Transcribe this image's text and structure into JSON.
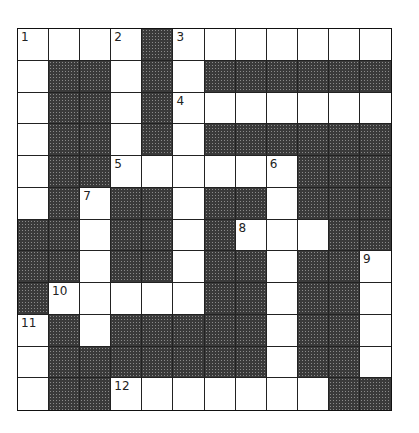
{
  "puzzle": {
    "rows": 12,
    "cols": 12,
    "grid": [
      "WWWWBWWWWWWW",
      "WBBWBWBBBBBB",
      "WBBWBWWWWWWW",
      "WBBWBWBBBBBB",
      "WBBWWWWWWBBB",
      "WBWBBWBBWBBB",
      "BBWBBWBWWWBB",
      "BBWBBWBBWBBW",
      "BWWWWWBBWBBW",
      "WBWBBBBBWBBW",
      "WBBBBBBBWBBW",
      "WBBWWWWWWWBB"
    ],
    "numbers": [
      {
        "label": "1",
        "row": 0,
        "col": 0
      },
      {
        "label": "2",
        "row": 0,
        "col": 3
      },
      {
        "label": "3",
        "row": 0,
        "col": 5
      },
      {
        "label": "4",
        "row": 2,
        "col": 5
      },
      {
        "label": "5",
        "row": 4,
        "col": 3
      },
      {
        "label": "6",
        "row": 4,
        "col": 8
      },
      {
        "label": "7",
        "row": 5,
        "col": 2
      },
      {
        "label": "8",
        "row": 6,
        "col": 7
      },
      {
        "label": "9",
        "row": 7,
        "col": 11
      },
      {
        "label": "10",
        "row": 8,
        "col": 1
      },
      {
        "label": "11",
        "row": 9,
        "col": 0
      },
      {
        "label": "12",
        "row": 11,
        "col": 3
      }
    ],
    "colors": {
      "white_cell": "#ffffff",
      "black_cell": "#3a3a3a",
      "grid_line": "#222222"
    }
  }
}
